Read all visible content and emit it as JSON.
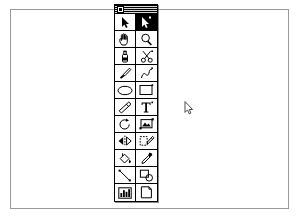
{
  "window": {
    "title": "Untitled Drawing",
    "background_color": "#ffffff",
    "frame_border_color": "#9a9a9a"
  },
  "canvas": {
    "name": "drawing-canvas",
    "background_color": "#ffffff"
  },
  "palette": {
    "title": "Tools",
    "close_box_label": "close",
    "selected_index": 1,
    "columns": 2,
    "rows": 11,
    "selected_highlight_color": "#000000",
    "ink_color": "#000000",
    "tools": [
      {
        "icon": "arrow-pointer-icon",
        "label": "Selection Arrow"
      },
      {
        "icon": "arrow-select-icon",
        "label": "Direct Select"
      },
      {
        "icon": "hand-icon",
        "label": "Hand"
      },
      {
        "icon": "magnifier-icon",
        "label": "Zoom"
      },
      {
        "icon": "spray-can-icon",
        "label": "Airbrush"
      },
      {
        "icon": "scissors-icon",
        "label": "Scissors"
      },
      {
        "icon": "paintbrush-icon",
        "label": "Paintbrush"
      },
      {
        "icon": "curve-icon",
        "label": "Freehand Curve"
      },
      {
        "icon": "ellipse-icon",
        "label": "Ellipse"
      },
      {
        "icon": "rectangle-icon",
        "label": "Rectangle"
      },
      {
        "icon": "eraser-icon",
        "label": "Eraser"
      },
      {
        "icon": "text-icon",
        "label": "Text"
      },
      {
        "icon": "rotate-icon",
        "label": "Rotate"
      },
      {
        "icon": "crop-image-icon",
        "label": "Crop"
      },
      {
        "icon": "mirror-flip-icon",
        "label": "Flip"
      },
      {
        "icon": "edit-shape-icon",
        "label": "Edit Shape"
      },
      {
        "icon": "paint-bucket-icon",
        "label": "Paint Bucket"
      },
      {
        "icon": "eyedropper-icon",
        "label": "Eyedropper"
      },
      {
        "icon": "line-icon",
        "label": "Line"
      },
      {
        "icon": "shapes-icon",
        "label": "Shapes"
      },
      {
        "icon": "bar-chart-icon",
        "label": "Chart"
      },
      {
        "icon": "page-icon",
        "label": "Page"
      }
    ]
  },
  "cursor": {
    "icon": "mouse-arrow-cursor",
    "x": 184,
    "y": 101
  }
}
